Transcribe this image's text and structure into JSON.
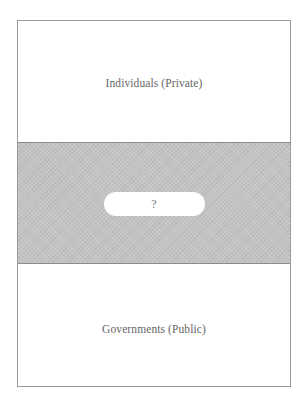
{
  "diagram": {
    "sections": [
      {
        "id": "top",
        "label": "Individuals (Private)"
      },
      {
        "id": "middle",
        "label": "?"
      },
      {
        "id": "bottom",
        "label": "Governments (Public)"
      }
    ],
    "colors": {
      "frame_border": "#9a9a9a",
      "middle_band": "#c4c4c4",
      "text": "#666666",
      "pill_fill": "#ffffff"
    }
  }
}
